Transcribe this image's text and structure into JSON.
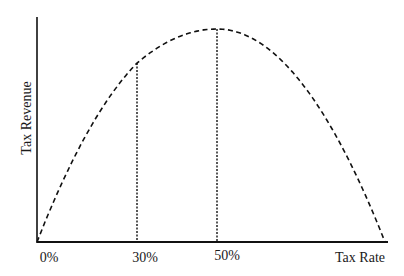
{
  "chart_data": {
    "type": "line",
    "title": "",
    "xlabel": "Tax Rate",
    "ylabel": "Tax Revenue",
    "xlim": [
      0,
      100
    ],
    "ylim": [
      0,
      1
    ],
    "grid": false,
    "legend": "none",
    "x_tick_labels": [
      "0%",
      "30%",
      "50%"
    ],
    "x_ticks": [
      0,
      30,
      50
    ],
    "series": [
      {
        "name": "Laffer curve",
        "style": "dashed",
        "x": [
          0,
          10,
          20,
          30,
          40,
          50,
          60,
          70,
          80,
          90,
          100
        ],
        "y": [
          0,
          0.36,
          0.64,
          0.84,
          0.96,
          1.0,
          0.96,
          0.84,
          0.64,
          0.36,
          0
        ]
      }
    ],
    "reference_lines": [
      {
        "x": 30,
        "y_top": 0.84,
        "style": "dotted"
      },
      {
        "x": 50,
        "y_top": 1.0,
        "style": "dotted"
      }
    ],
    "colors": {
      "axis": "#111111",
      "curve": "#111111"
    }
  }
}
